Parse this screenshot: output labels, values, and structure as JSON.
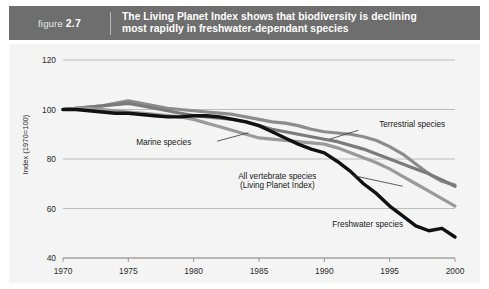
{
  "figure": {
    "label_prefix": "figure",
    "label_number": "2.7",
    "title_line1": "The Living Planet Index shows that biodiversity is declining",
    "title_line2": "most rapidly in freshwater-dependant species",
    "header_bg": "#6e6e6e",
    "header_text_color": "#ffffff"
  },
  "chart_data": {
    "type": "line",
    "title": "The Living Planet Index shows that biodiversity is declining most rapidly in freshwater-dependant species",
    "xlabel": "",
    "ylabel": "Index (1970=100)",
    "xlim": [
      1970,
      2000
    ],
    "ylim": [
      40,
      120
    ],
    "yticks": [
      40,
      60,
      80,
      100,
      120
    ],
    "xticks": [
      1970,
      1975,
      1980,
      1985,
      1990,
      1995,
      2000
    ],
    "grid": true,
    "legend_position": "inline-annotations",
    "x": [
      1970,
      1971,
      1972,
      1973,
      1974,
      1975,
      1976,
      1977,
      1978,
      1979,
      1980,
      1981,
      1982,
      1983,
      1984,
      1985,
      1986,
      1987,
      1988,
      1989,
      1990,
      1991,
      1992,
      1993,
      1994,
      1995,
      1996,
      1997,
      1998,
      1999,
      2000
    ],
    "series": [
      {
        "name": "Terrestrial species",
        "color": "#8c8c8c",
        "width": 3.2,
        "values": [
          100,
          100.5,
          101,
          101.5,
          102.5,
          103.5,
          102.5,
          101.5,
          100.5,
          100,
          99.5,
          99,
          98.5,
          98,
          97,
          96,
          95,
          94.5,
          93.5,
          92,
          91,
          90.5,
          90,
          89,
          87.5,
          85,
          82,
          78,
          74,
          71,
          69.5
        ]
      },
      {
        "name": "Marine species",
        "color": "#7a7a7a",
        "width": 3.2,
        "values": [
          100,
          100.5,
          101,
          101.5,
          102,
          102.5,
          101.5,
          100.5,
          99.5,
          98.5,
          97.5,
          97,
          96.5,
          96,
          95,
          93.5,
          92,
          91,
          90,
          89,
          88,
          87,
          85.5,
          84,
          82,
          80,
          78,
          76,
          74,
          71.5,
          69
        ]
      },
      {
        "name": "All vertebrate species (Living Planet Index)",
        "color": "#9a9a9a",
        "width": 3.2,
        "values": [
          100,
          100.5,
          100.5,
          100,
          99.5,
          99,
          98.5,
          98,
          97.5,
          97,
          96,
          94.5,
          93,
          91.5,
          90,
          88.5,
          88,
          87.5,
          87,
          86.5,
          86,
          84.5,
          82.5,
          80.5,
          78.5,
          76,
          73,
          70,
          67,
          64,
          61
        ]
      },
      {
        "name": "Freshwater species",
        "color": "#111111",
        "width": 3.4,
        "values": [
          100,
          100,
          99.5,
          99,
          98.5,
          98.5,
          98,
          97.5,
          97,
          97,
          97.5,
          97.5,
          97,
          96,
          95,
          93.5,
          91,
          88.5,
          86,
          84,
          82.5,
          79,
          75,
          70,
          66,
          61,
          57,
          53,
          51,
          52,
          48.5
        ]
      }
    ],
    "annotations": [
      {
        "text": "Terrestrial species",
        "x": 1994.2,
        "y": 93.0,
        "align": "left",
        "leader": {
          "from_x": 1992.6,
          "from_y": 91.6,
          "to_x": 1990.4,
          "to_y": 88.0
        }
      },
      {
        "text": "Marine species",
        "x": 1975.6,
        "y": 85.5,
        "align": "left",
        "leader": {
          "from_x": 1981.8,
          "from_y": 87.2,
          "to_x": 1984.2,
          "to_y": 90.6
        }
      },
      {
        "text_line1": "All vertebrate species",
        "text_line2": "(Living Planet Index)",
        "x": 1986.4,
        "y": 72.0,
        "align": "center",
        "leader": {
          "from_x": 1992.2,
          "from_y": 73.3,
          "to_x": 1996.0,
          "to_y": 69.0
        }
      },
      {
        "text": "Freshwater species",
        "x": 1990.6,
        "y": 52.5,
        "align": "left",
        "leader": null
      }
    ]
  }
}
